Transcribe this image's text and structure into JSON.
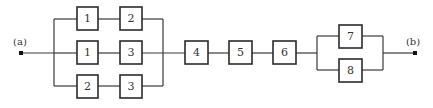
{
  "diagram": {
    "type": "reliability-block-diagram",
    "terminals": [
      {
        "id": "a",
        "label": "(a)",
        "x": 21,
        "y": 53
      },
      {
        "id": "b",
        "label": "(b)",
        "x": 415,
        "y": 53
      }
    ],
    "blocks": [
      {
        "id": "r1c1",
        "label": "1",
        "x": 77,
        "y": 7
      },
      {
        "id": "r1c2",
        "label": "2",
        "x": 120,
        "y": 7
      },
      {
        "id": "r2c1",
        "label": "1",
        "x": 77,
        "y": 41
      },
      {
        "id": "r2c2",
        "label": "3",
        "x": 120,
        "y": 41
      },
      {
        "id": "r3c1",
        "label": "2",
        "x": 77,
        "y": 75
      },
      {
        "id": "r3c2",
        "label": "3",
        "x": 120,
        "y": 75
      },
      {
        "id": "b4",
        "label": "4",
        "x": 185,
        "y": 41
      },
      {
        "id": "b5",
        "label": "5",
        "x": 229,
        "y": 41
      },
      {
        "id": "b6",
        "label": "6",
        "x": 273,
        "y": 41
      },
      {
        "id": "b7",
        "label": "7",
        "x": 339,
        "y": 25
      },
      {
        "id": "b8",
        "label": "8",
        "x": 339,
        "y": 59
      }
    ],
    "structure": "a -> parallel{[1-2],[1-3],[2-3]} -> 4 -> 5 -> 6 -> parallel{7,8} -> b"
  }
}
